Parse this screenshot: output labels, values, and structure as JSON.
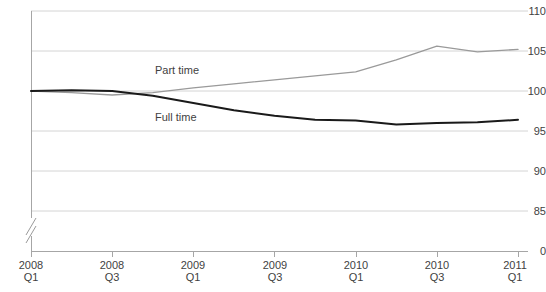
{
  "chart_data": {
    "type": "line",
    "title": "",
    "xlabel": "",
    "ylabel": "",
    "ylim": [
      85,
      110
    ],
    "y_axis_break": true,
    "y_zero_label": "0",
    "yticks": [
      110,
      105,
      100,
      95,
      90,
      85,
      0
    ],
    "ytick_labels": [
      "110",
      "105",
      "100",
      "95",
      "90",
      "85",
      "0"
    ],
    "grid": true,
    "legend_position": "inline-annotation",
    "x": [
      "2008 Q1",
      "2008 Q2",
      "2008 Q3",
      "2008 Q4",
      "2009 Q1",
      "2009 Q2",
      "2009 Q3",
      "2009 Q4",
      "2010 Q1",
      "2010 Q2",
      "2010 Q3",
      "2010 Q4",
      "2011 Q1"
    ],
    "xtick_labels": [
      {
        "year": "2008",
        "quarter": "Q1"
      },
      {
        "year": "2008",
        "quarter": "Q3"
      },
      {
        "year": "2009",
        "quarter": "Q1"
      },
      {
        "year": "2009",
        "quarter": "Q3"
      },
      {
        "year": "2010",
        "quarter": "Q1"
      },
      {
        "year": "2010",
        "quarter": "Q3"
      },
      {
        "year": "2011",
        "quarter": "Q1"
      }
    ],
    "series": [
      {
        "name": "Part time",
        "color": "#9a9a9a",
        "label_x": 155,
        "label_y": 65,
        "values": [
          100.0,
          99.8,
          99.5,
          99.8,
          100.4,
          100.9,
          101.4,
          101.9,
          102.4,
          103.9,
          105.6,
          104.9,
          105.2
        ]
      },
      {
        "name": "Full time",
        "color": "#1a1a1a",
        "label_x": 155,
        "label_y": 112,
        "values": [
          100.0,
          100.1,
          100.0,
          99.4,
          98.5,
          97.6,
          96.9,
          96.4,
          96.3,
          95.8,
          96.0,
          96.1,
          96.4
        ]
      }
    ]
  },
  "axis": {
    "axis_color": "#a6a6a6",
    "grid_color": "#d4d4d4",
    "tick_text_color": "#3f3f3f"
  }
}
